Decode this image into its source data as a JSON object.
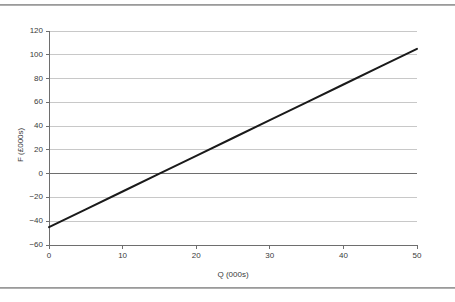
{
  "chart_data": {
    "type": "line",
    "title": "",
    "xlabel": "Q (000s)",
    "ylabel": "F (£000s)",
    "xlim": [
      0,
      50
    ],
    "ylim": [
      -60,
      120
    ],
    "xticks": [
      0,
      10,
      20,
      30,
      40,
      50
    ],
    "yticks": [
      -60,
      -40,
      -20,
      0,
      20,
      40,
      60,
      80,
      100,
      120
    ],
    "xtick_labels": [
      "0",
      "10",
      "20",
      "30",
      "40",
      "50"
    ],
    "ytick_labels": [
      "120",
      "100",
      "80",
      "60",
      "40",
      "20",
      "0",
      "−20",
      "−40",
      "−60"
    ],
    "grid": true,
    "grid_axis": "y",
    "legend": "none",
    "series": [
      {
        "name": "F",
        "equation": "F = 3Q - 45",
        "slope": 3.0,
        "intercept": -45,
        "color": "#1a1a1a",
        "line_width": 2,
        "x": [
          0,
          5,
          10,
          15,
          20,
          25,
          30,
          35,
          40,
          45,
          50
        ],
        "values": [
          -45,
          -30,
          -15,
          0,
          15,
          30,
          45,
          60,
          75,
          90,
          105
        ]
      }
    ],
    "annotations": []
  },
  "style": {
    "grid_color": "#c8c8c8",
    "axis_color": "#6e6e6e",
    "zero_line_color": "#6e6e6e",
    "text_color": "#3a3a3a",
    "background": "#ffffff",
    "frame_rule_color": "#9a9a9a"
  }
}
